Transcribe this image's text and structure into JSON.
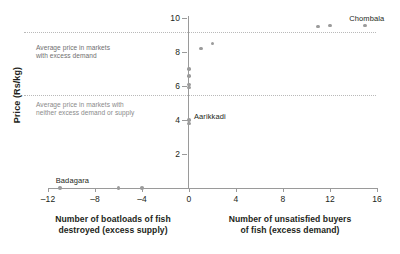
{
  "chart_data": {
    "type": "scatter",
    "title": "",
    "xlabel_left": "Number of boatloads of fish\ndestroyed (excess supply)",
    "xlabel_right": "Number of unsatisfied buyers\nof fish (excess demand)",
    "ylabel": "Price (Rs/kg)",
    "xlim": [
      -12,
      16
    ],
    "ylim": [
      0,
      10
    ],
    "xticks": [
      -12,
      -8,
      -4,
      0,
      4,
      8,
      12,
      16
    ],
    "xtick_labels": [
      "–12",
      "–8",
      "–4",
      "0",
      "4",
      "8",
      "12",
      "16"
    ],
    "yticks": [
      2,
      4,
      6,
      8,
      10
    ],
    "ytick_labels": [
      "2",
      "4",
      "6",
      "8",
      "10"
    ],
    "grid": false,
    "legend": "none",
    "points": [
      {
        "x": -11,
        "y": 0,
        "label": "Badagara"
      },
      {
        "x": -6,
        "y": 0,
        "label": ""
      },
      {
        "x": -4,
        "y": 0,
        "label": ""
      },
      {
        "x": 0,
        "y": 3.8,
        "label": ""
      },
      {
        "x": 0,
        "y": 4.0,
        "label": "Aarikkadi"
      },
      {
        "x": 0,
        "y": 5.9,
        "label": ""
      },
      {
        "x": 0,
        "y": 6.1,
        "label": ""
      },
      {
        "x": 0,
        "y": 6.6,
        "label": ""
      },
      {
        "x": 0,
        "y": 7.0,
        "label": ""
      },
      {
        "x": 1,
        "y": 8.2,
        "label": ""
      },
      {
        "x": 2,
        "y": 8.5,
        "label": ""
      },
      {
        "x": 11,
        "y": 9.5,
        "label": ""
      },
      {
        "x": 12,
        "y": 9.55,
        "label": ""
      },
      {
        "x": 15,
        "y": 9.55,
        "label": "Chombala"
      }
    ],
    "reference_lines": [
      {
        "value": 9.2,
        "annotation": "Average price in markets\nwith excess demand"
      },
      {
        "value": 5.5,
        "annotation": "Average price in markets with\nneither excess demand or supply"
      }
    ],
    "colors": {
      "point": "#9b9b9b",
      "axis": "#9a9a9a",
      "refline": "#b9b9b9",
      "text": "#231f20",
      "annotation": "#8a8a8a"
    }
  },
  "annotations": {
    "excess_demand": "Average price in markets\nwith excess demand",
    "neither": "Average price in markets with\nneither excess demand or supply"
  },
  "point_labels": {
    "badagara": "Badagara",
    "aarikkadi": "Aarikkadi",
    "chombala": "Chombala"
  }
}
